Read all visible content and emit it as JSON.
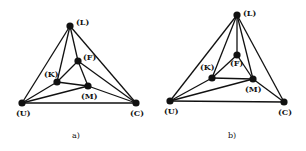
{
  "figures": [
    {
      "caption": "a)",
      "caption_pos": [
        72,
        138
      ],
      "nodes": [
        {
          "id": "L",
          "label": "(L)",
          "x": 70,
          "y": 26,
          "lx": 76,
          "ly": 25
        },
        {
          "id": "F",
          "label": "(F)",
          "x": 78,
          "y": 61,
          "lx": 83,
          "ly": 60
        },
        {
          "id": "K",
          "label": "(K)",
          "x": 57,
          "y": 82,
          "lx": 44,
          "ly": 77
        },
        {
          "id": "M",
          "label": "(M)",
          "x": 88,
          "y": 86,
          "lx": 81,
          "ly": 99
        },
        {
          "id": "U",
          "label": "(U)",
          "x": 22,
          "y": 103,
          "lx": 16,
          "ly": 116
        },
        {
          "id": "C",
          "label": "(C)",
          "x": 136,
          "y": 103,
          "lx": 130,
          "ly": 116
        }
      ],
      "edges": [
        [
          "L",
          "U"
        ],
        [
          "L",
          "C"
        ],
        [
          "L",
          "K"
        ],
        [
          "L",
          "F"
        ],
        [
          "F",
          "K"
        ],
        [
          "F",
          "M"
        ],
        [
          "F",
          "C"
        ],
        [
          "K",
          "M"
        ],
        [
          "K",
          "U"
        ],
        [
          "M",
          "U"
        ],
        [
          "M",
          "C"
        ],
        [
          "U",
          "C"
        ]
      ]
    },
    {
      "caption": "b)",
      "caption_pos": [
        228,
        138
      ],
      "nodes": [
        {
          "id": "L",
          "label": "(L)",
          "x": 237,
          "y": 15,
          "lx": 243,
          "ly": 16
        },
        {
          "id": "F",
          "label": "(F)",
          "x": 237,
          "y": 55,
          "lx": 230,
          "ly": 66
        },
        {
          "id": "K",
          "label": "(K)",
          "x": 212,
          "y": 78,
          "lx": 200,
          "ly": 70
        },
        {
          "id": "M",
          "label": "(M)",
          "x": 253,
          "y": 79,
          "lx": 245,
          "ly": 92
        },
        {
          "id": "U",
          "label": "(U)",
          "x": 170,
          "y": 101,
          "lx": 164,
          "ly": 114
        },
        {
          "id": "C",
          "label": "(C)",
          "x": 284,
          "y": 102,
          "lx": 278,
          "ly": 115
        }
      ],
      "edges": [
        [
          "L",
          "U"
        ],
        [
          "L",
          "C"
        ],
        [
          "L",
          "K"
        ],
        [
          "L",
          "F"
        ],
        [
          "L",
          "M"
        ],
        [
          "F",
          "K"
        ],
        [
          "F",
          "M"
        ],
        [
          "K",
          "M"
        ],
        [
          "K",
          "U"
        ],
        [
          "M",
          "U"
        ],
        [
          "M",
          "C"
        ],
        [
          "U",
          "C"
        ]
      ]
    }
  ]
}
